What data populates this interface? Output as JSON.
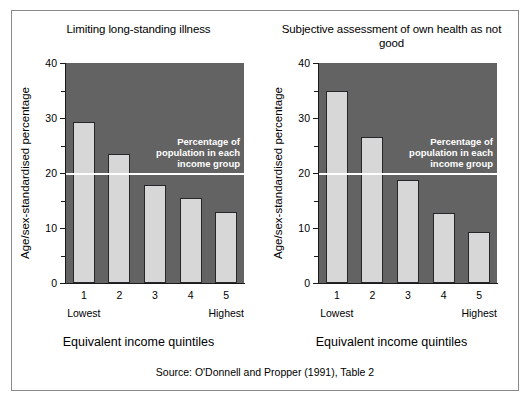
{
  "figure": {
    "source_note": "Source: O'Donnell and Propper (1991), Table 2",
    "colors": {
      "plot_background": "#636363",
      "bar_fill": "#d7d7d7",
      "bar_edge": "#26262a",
      "reference_line": "#ffffff",
      "frame_border": "#8a8a8a"
    }
  },
  "chart_data": [
    {
      "type": "bar",
      "title": "Limiting long-standing illness",
      "xlabel": "Equivalent income quintiles",
      "ylabel": "Age/sex-standardised percentage",
      "categories": [
        "1",
        "2",
        "3",
        "4",
        "5"
      ],
      "category_end_labels": {
        "first": "Lowest",
        "last": "Highest"
      },
      "values": [
        29.3,
        23.5,
        17.8,
        15.5,
        13.0
      ],
      "ylim": [
        0,
        40
      ],
      "ytick_major": [
        0,
        10,
        20,
        30,
        40
      ],
      "ytick_minor": [
        5,
        15,
        25,
        35
      ],
      "ytick_labels": [
        "0",
        "10",
        "20",
        "30",
        "40"
      ],
      "grid": false,
      "annotations": [
        {
          "type": "reference-line",
          "value": 20,
          "label": "Percentage of\npopulation in each\nincome group"
        }
      ]
    },
    {
      "type": "bar",
      "title": "Subjective assessment of own health as not good",
      "xlabel": "Equivalent income quintiles",
      "ylabel": "Age/sex-standardised percentage",
      "categories": [
        "1",
        "2",
        "3",
        "4",
        "5"
      ],
      "category_end_labels": {
        "first": "Lowest",
        "last": "Highest"
      },
      "values": [
        35.0,
        26.5,
        18.7,
        12.8,
        9.3
      ],
      "ylim": [
        0,
        40
      ],
      "ytick_major": [
        0,
        10,
        20,
        30,
        40
      ],
      "ytick_minor": [
        5,
        15,
        25,
        35
      ],
      "ytick_labels": [
        "0",
        "10",
        "20",
        "30",
        "40"
      ],
      "grid": false,
      "annotations": [
        {
          "type": "reference-line",
          "value": 20,
          "label": "Percentage of\npopulation in each\nincome group"
        }
      ]
    }
  ]
}
